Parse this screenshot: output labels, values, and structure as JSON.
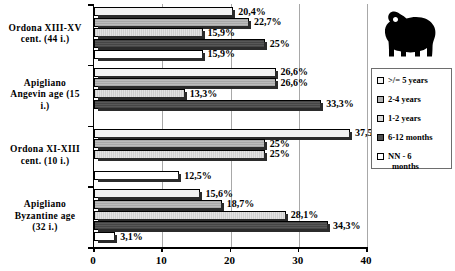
{
  "chart_data": {
    "type": "bar",
    "orientation": "horizontal",
    "grouped": true,
    "title": "",
    "xlabel": "",
    "ylabel": "",
    "xlim": [
      0,
      40
    ],
    "xticks": [
      "0",
      "10",
      "20",
      "30",
      "40"
    ],
    "xtick_values": [
      0,
      10,
      20,
      30,
      40
    ],
    "grid": "vertical",
    "legend_position": "right",
    "categories": [
      "Ordona XIII-XV cent. (44 i.)",
      "Apigliano Angevin age (15 i.)",
      "Ordona XI-XIII cent. (10 i.)",
      "Apigliano Byzantine age (32 i.)"
    ],
    "series": [
      {
        "name": ">/= 5 years",
        "color": "#f2f2f2",
        "values": [
          20.4,
          26.6,
          37.5,
          15.6
        ],
        "labels": [
          "20,4%",
          "26,6%",
          "37,5%",
          "15,6%"
        ]
      },
      {
        "name": "2-4 years",
        "color": "#b3b3b3",
        "values": [
          22.7,
          26.6,
          25.0,
          18.7
        ],
        "labels": [
          "22,7%",
          "26,6%",
          "25%",
          "18,7%"
        ]
      },
      {
        "name": "1-2 years",
        "color": "#d9d9d9",
        "values": [
          15.9,
          13.3,
          25.0,
          28.1
        ],
        "labels": [
          "15,9%",
          "13,3%",
          "25%",
          "28,1%"
        ]
      },
      {
        "name": "6-12 months",
        "color": "#4f4f4f",
        "values": [
          25.0,
          33.3,
          0.0,
          34.3
        ],
        "labels": [
          "25%",
          "33,3%",
          "",
          "34,3%"
        ]
      },
      {
        "name": "NN - 6 months",
        "color": "#ffffff",
        "values": [
          15.9,
          0.0,
          12.5,
          3.1
        ],
        "labels": [
          "15,9%",
          "",
          "12,5%",
          "3,1%"
        ]
      }
    ]
  },
  "legend": {
    "items": [
      {
        "label": ">/= 5 years"
      },
      {
        "label": "2-4 years"
      },
      {
        "label": "1-2 years"
      },
      {
        "label": "6-12 months"
      },
      {
        "label": "NN - 6 months"
      }
    ]
  },
  "decoration": {
    "sheep_icon": "sheep-silhouette-icon"
  }
}
